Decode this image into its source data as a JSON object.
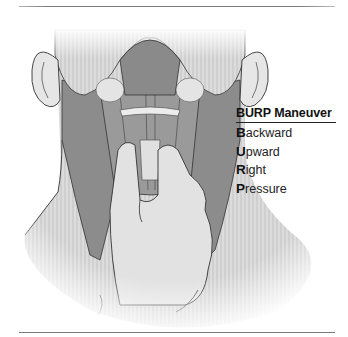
{
  "figure": {
    "colors": {
      "rule": "#7a7a7a",
      "skin": "#d8d8d8",
      "muscle": "#8a8a8a",
      "outline": "#333333"
    }
  },
  "legend": {
    "title": "BURP Maneuver",
    "items": [
      {
        "initial": "B",
        "rest": "ackward"
      },
      {
        "initial": "U",
        "rest": "pward"
      },
      {
        "initial": "R",
        "rest": "ight"
      },
      {
        "initial": "P",
        "rest": "ressure"
      }
    ]
  }
}
